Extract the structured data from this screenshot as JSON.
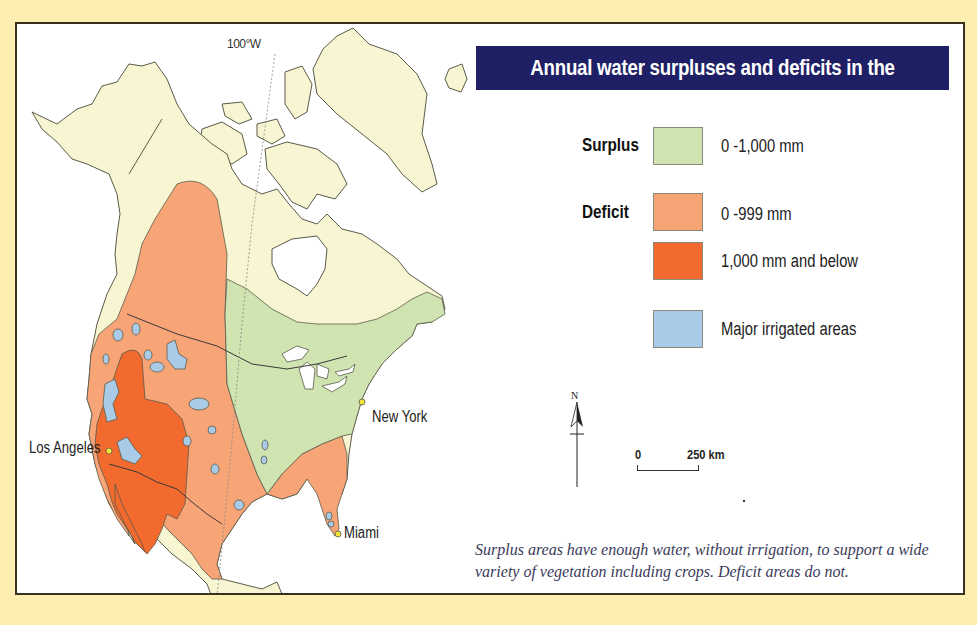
{
  "page": {
    "background_color": "#fbeeb0",
    "map_background": "#ffffff"
  },
  "title": "Annual water surpluses and deficits in the USA",
  "map": {
    "meridian_label": "100°W",
    "cities": [
      {
        "name": "Los Angeles"
      },
      {
        "name": "New York"
      },
      {
        "name": "Miami"
      }
    ],
    "colors": {
      "land": "#f8f6d2",
      "surplus": "#cfe4b0",
      "deficit_light": "#f7a576",
      "deficit_dark": "#f26a2e",
      "irrigated": "#a9cbe8",
      "outline": "#5a5a4a",
      "city_dot": "#f2e43a"
    }
  },
  "legend": {
    "surplus_label": "Surplus",
    "deficit_label": "Deficit",
    "items": [
      {
        "group": "Surplus",
        "label": "0 -1,000 mm",
        "color": "#cfe4b0"
      },
      {
        "group": "Deficit",
        "label": "0 -999 mm",
        "color": "#f7a576"
      },
      {
        "group": "Deficit",
        "label": "1,000 mm and below",
        "color": "#f26a2e"
      },
      {
        "group": "",
        "label": "Major irrigated areas",
        "color": "#a9cbe8"
      }
    ]
  },
  "north_arrow": {
    "label": "N"
  },
  "scale": {
    "start": "0",
    "end": "250 km"
  },
  "caption": "Surplus areas have enough water, without irrigation, to support a wide variety of vegetation including crops. Deficit areas do not."
}
